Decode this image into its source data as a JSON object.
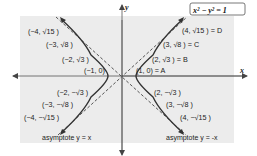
{
  "diagram": {
    "equation": "x² − y² = 1",
    "axes": {
      "x_label": "x",
      "y_label": "y"
    },
    "colors": {
      "background_panel": "#ececec",
      "curve": "#333333",
      "asymptote": "#555555",
      "axis": "#555555"
    },
    "points_right": [
      {
        "label": "(1, 0) = A"
      },
      {
        "label": "(2, √3 ) = B"
      },
      {
        "label": "(3, √8 ) = C"
      },
      {
        "label": "(4, √15 ) = D"
      },
      {
        "label": "(2, −√3 )"
      },
      {
        "label": "(3, −√8 )"
      },
      {
        "label": "(4, −√15 )"
      }
    ],
    "points_left": [
      {
        "label": "(−1, 0)"
      },
      {
        "label": "(−2, √3 )"
      },
      {
        "label": "(−3, √8 )"
      },
      {
        "label": "(−4, √15 )"
      },
      {
        "label": "(−2, −√3 )"
      },
      {
        "label": "(−3, −√8 )"
      },
      {
        "label": "(−4, −√15 )"
      }
    ],
    "asymptotes": [
      {
        "label": "asymptote y = x"
      },
      {
        "label": "asymptote y = -x"
      }
    ]
  }
}
